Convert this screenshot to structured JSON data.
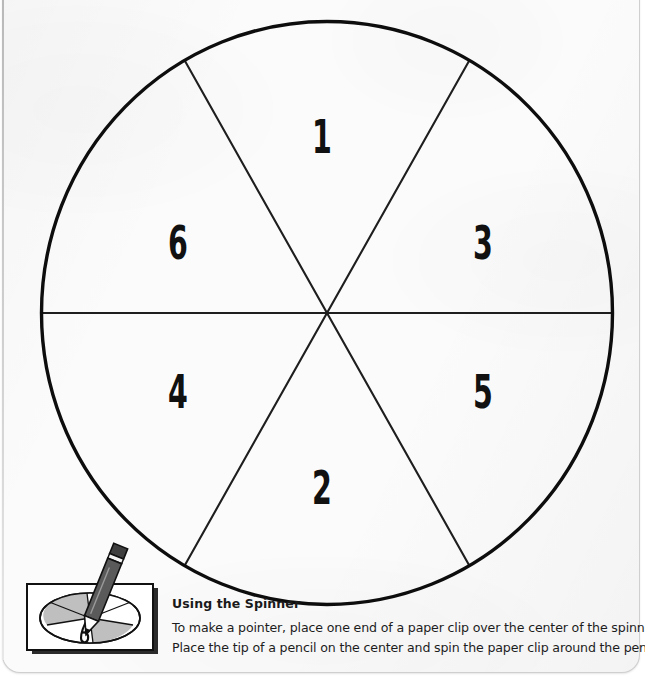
{
  "worksheet": {
    "title": "Using the Spinner",
    "instruction_lines": [
      "To make a pointer, place one end of a paper clip over the center of the spinner.",
      "Place the tip of a pencil on the center and spin the paper clip around the pencil point."
    ]
  },
  "spinner": {
    "type": "six-sector-spinner",
    "sector_count": 6,
    "sectors": [
      {
        "label": "1",
        "position": "top",
        "center_x": 322,
        "center_y": 137,
        "angle_deg": 90
      },
      {
        "label": "3",
        "position": "upper-right",
        "center_x": 483,
        "center_y": 243,
        "angle_deg": 30
      },
      {
        "label": "5",
        "position": "lower-right",
        "center_x": 483,
        "center_y": 392,
        "angle_deg": 330
      },
      {
        "label": "2",
        "position": "bottom",
        "center_x": 322,
        "center_y": 488,
        "angle_deg": 270
      },
      {
        "label": "4",
        "position": "lower-left",
        "center_x": 178,
        "center_y": 392,
        "angle_deg": 210
      },
      {
        "label": "6",
        "position": "upper-left",
        "center_x": 178,
        "center_y": 243,
        "angle_deg": 150
      }
    ],
    "geometry": {
      "center_x": 327,
      "center_y": 313,
      "radius_x": 286,
      "radius_y": 292
    },
    "colors": {
      "outline": "#111111",
      "divider": "#222222",
      "fill": "#ffffff"
    }
  },
  "illustration": {
    "name": "pencil-and-paperclip-spinner-photo",
    "colors": {
      "frame": "#111111",
      "disc_shade": "#b9b9b9",
      "disc_light": "#ffffff",
      "pencil_body": "#4a4a4a",
      "pencil_band": "#f2f2f2"
    }
  },
  "colors": {
    "paper": "#fbfbfb",
    "ink": "#1a1a1a",
    "page_border": "#cfcfcf"
  }
}
